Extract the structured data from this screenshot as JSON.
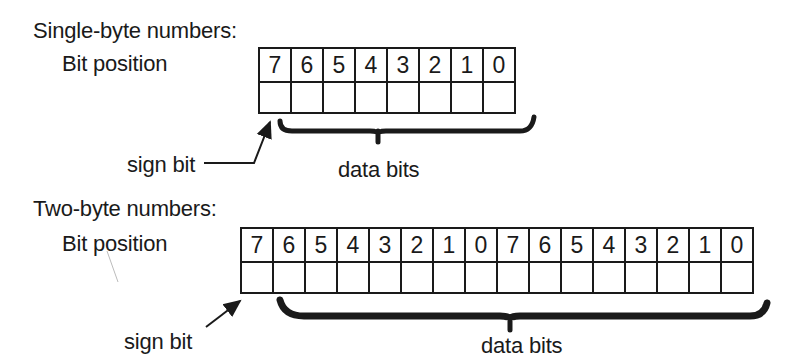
{
  "single_byte": {
    "title": "Single-byte numbers:",
    "row_label": "Bit position",
    "bits": [
      "7",
      "6",
      "5",
      "4",
      "3",
      "2",
      "1",
      "0"
    ],
    "sign_label": "sign bit",
    "data_label": "data bits"
  },
  "two_byte": {
    "title": "Two-byte numbers:",
    "row_label": "Bit position",
    "bits": [
      "7",
      "6",
      "5",
      "4",
      "3",
      "2",
      "1",
      "0",
      "7",
      "6",
      "5",
      "4",
      "3",
      "2",
      "1",
      "0"
    ],
    "sign_label": "sign bit",
    "data_label": "data bits"
  }
}
